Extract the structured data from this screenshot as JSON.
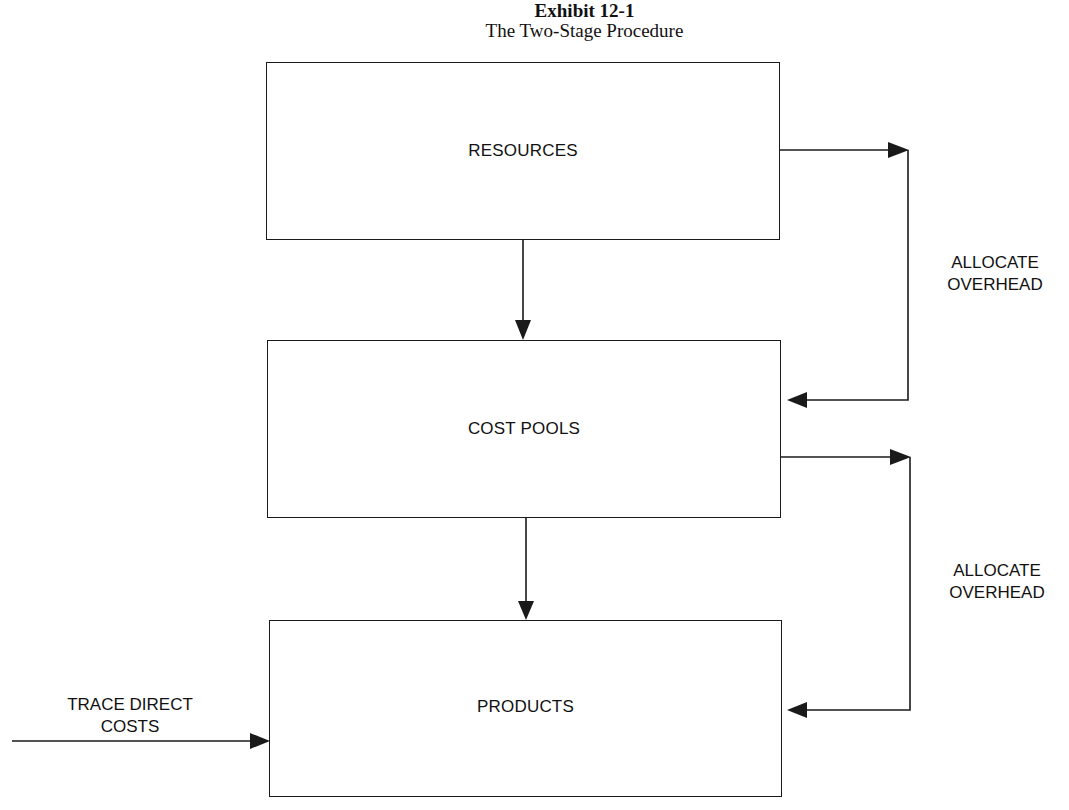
{
  "header": {
    "exhibit": "Exhibit 12-1",
    "subtitle": "The Two-Stage Procedure"
  },
  "boxes": [
    {
      "id": "resources",
      "label": "RESOURCES"
    },
    {
      "id": "cost_pools",
      "label": "COST POOLS"
    },
    {
      "id": "products",
      "label": "PRODUCTS"
    }
  ],
  "labels": {
    "allocate_1_line1": "ALLOCATE",
    "allocate_1_line2": "OVERHEAD",
    "allocate_2_line1": "ALLOCATE",
    "allocate_2_line2": "OVERHEAD",
    "trace_line1": "TRACE DIRECT",
    "trace_line2": "COSTS"
  },
  "edges": [
    {
      "from": "resources",
      "to": "cost_pools",
      "type": "down-arrow"
    },
    {
      "from": "cost_pools",
      "to": "products",
      "type": "down-arrow"
    },
    {
      "from": "resources",
      "to": "cost_pools",
      "type": "side-loop",
      "label": "ALLOCATE OVERHEAD"
    },
    {
      "from": "cost_pools",
      "to": "products",
      "type": "side-loop",
      "label": "ALLOCATE OVERHEAD"
    },
    {
      "from": "external",
      "to": "products",
      "type": "inbound-arrow",
      "label": "TRACE DIRECT COSTS"
    }
  ],
  "colors": {
    "line": "#1a1a1a",
    "background": "#ffffff"
  }
}
